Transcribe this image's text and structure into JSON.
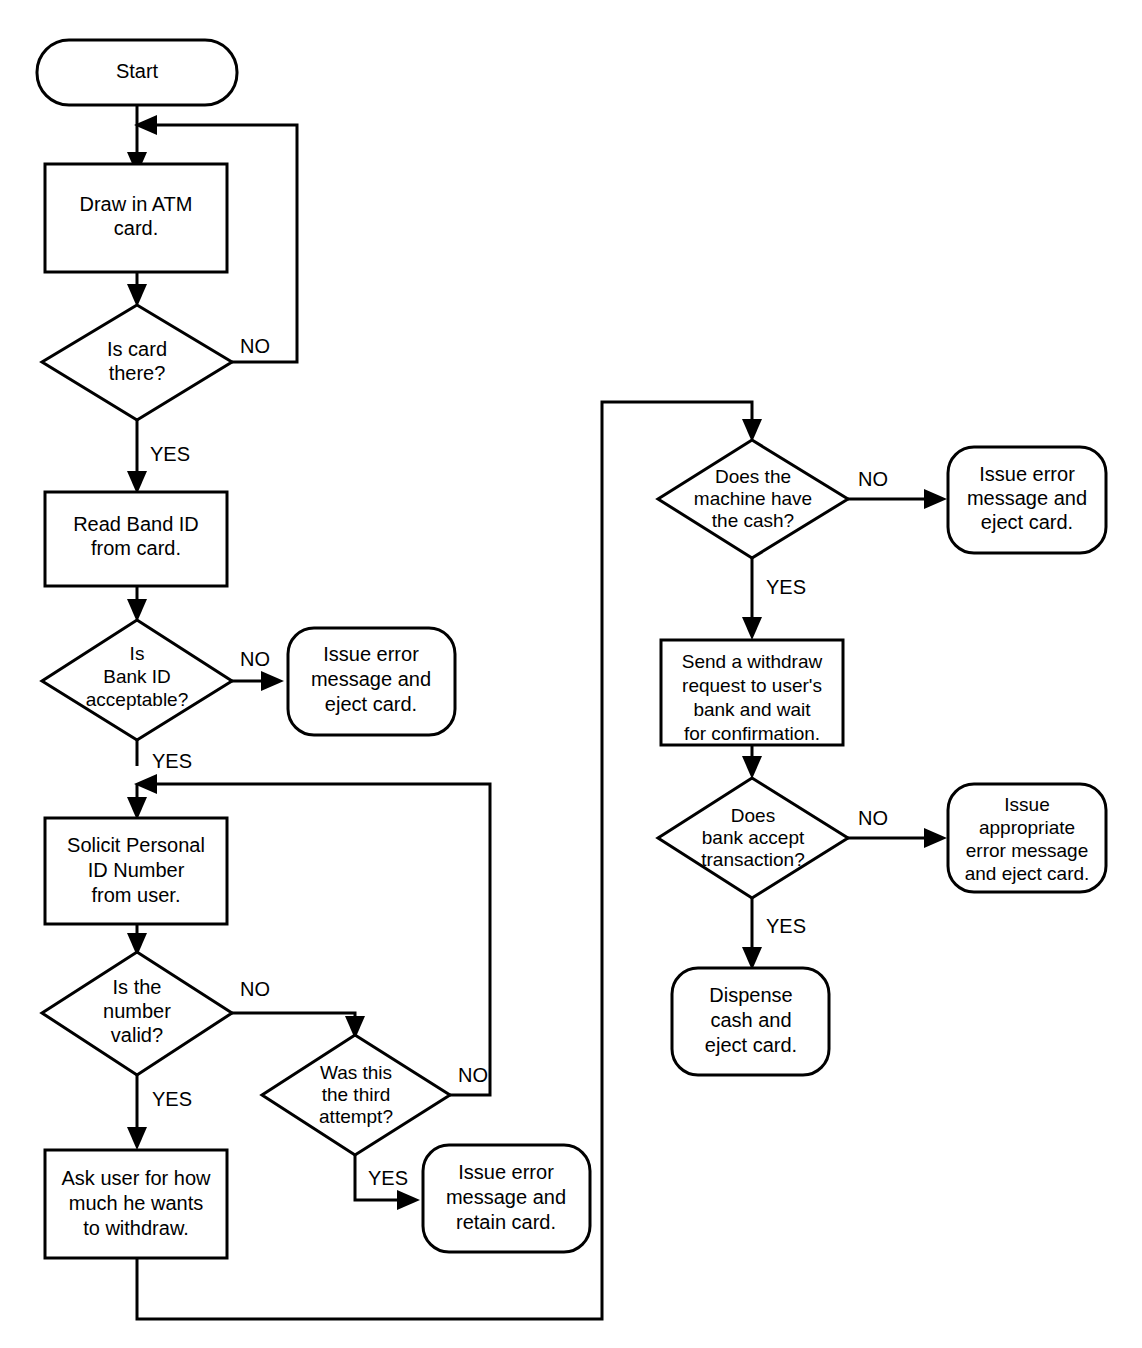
{
  "diagram": {
    "type": "flowchart",
    "stroke_color": "#000000",
    "fill_color": "#ffffff",
    "background": "#ffffff"
  },
  "nodes": {
    "start": {
      "shape": "terminator",
      "lines": [
        "Start"
      ]
    },
    "draw_card": {
      "shape": "process",
      "lines": [
        "Draw in ATM",
        "card."
      ]
    },
    "is_card_there": {
      "shape": "decision",
      "lines": [
        "Is card",
        "there?"
      ]
    },
    "read_bank_id": {
      "shape": "process",
      "lines": [
        "Read Band ID",
        "from card."
      ]
    },
    "is_bank_id_ok": {
      "shape": "decision",
      "lines": [
        "Is",
        "Bank ID",
        "acceptable?"
      ]
    },
    "err_eject_1": {
      "shape": "terminator",
      "lines": [
        "Issue error",
        "message and",
        "eject card."
      ]
    },
    "solicit_pin": {
      "shape": "process",
      "lines": [
        "Solicit Personal",
        "ID Number",
        "from user."
      ]
    },
    "is_number_valid": {
      "shape": "decision",
      "lines": [
        "Is the",
        "number",
        "valid?"
      ]
    },
    "third_attempt": {
      "shape": "decision",
      "lines": [
        "Was this",
        "the third",
        "attempt?"
      ]
    },
    "err_retain": {
      "shape": "terminator",
      "lines": [
        "Issue error",
        "message and",
        "retain card."
      ]
    },
    "ask_amount": {
      "shape": "process",
      "lines": [
        "Ask user for how",
        "much he wants",
        "to withdraw."
      ]
    },
    "has_cash": {
      "shape": "decision",
      "lines": [
        "Does the",
        "machine have",
        "the cash?"
      ]
    },
    "err_eject_2": {
      "shape": "terminator",
      "lines": [
        "Issue error",
        "message and",
        "eject card."
      ]
    },
    "send_withdraw": {
      "shape": "process",
      "lines": [
        "Send a withdraw",
        "request to user's",
        "bank and wait",
        "for confirmation."
      ]
    },
    "bank_accepts": {
      "shape": "decision",
      "lines": [
        "Does",
        "bank accept",
        "transaction?"
      ]
    },
    "err_appropriate": {
      "shape": "terminator",
      "lines": [
        "Issue",
        "appropriate",
        "error message",
        "and eject card."
      ]
    },
    "dispense": {
      "shape": "terminator",
      "lines": [
        "Dispense",
        "cash and",
        "eject card."
      ]
    }
  },
  "edge_labels": {
    "card_no": "NO",
    "card_yes": "YES",
    "bankid_no": "NO",
    "bankid_yes": "YES",
    "number_no": "NO",
    "number_yes": "YES",
    "third_no": "NO",
    "third_yes": "YES",
    "cash_no": "NO",
    "cash_yes": "YES",
    "accept_no": "NO",
    "accept_yes": "YES"
  }
}
